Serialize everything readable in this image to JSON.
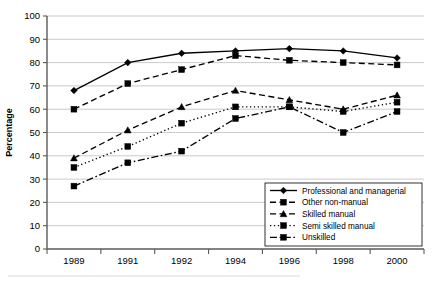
{
  "chart_data": {
    "type": "line",
    "title": "",
    "xlabel": "",
    "ylabel": "Percentage",
    "categories": [
      "1989",
      "1991",
      "1992",
      "1994",
      "1996",
      "1998",
      "2000"
    ],
    "x": [
      1989,
      1991,
      1992,
      1994,
      1996,
      1998,
      2000
    ],
    "ylim": [
      0,
      100
    ],
    "yticks": [
      0,
      10,
      20,
      30,
      40,
      50,
      60,
      70,
      80,
      90,
      100
    ],
    "grid": "horizontal",
    "legend_position": "bottom-right",
    "series": [
      {
        "name": "Professional and managerial",
        "values": [
          68,
          80,
          84,
          85,
          86,
          85,
          82
        ],
        "line_style": "solid",
        "marker": "diamond",
        "color": "#000000"
      },
      {
        "name": "Other non-manual",
        "values": [
          60,
          71,
          77,
          83,
          81,
          80,
          79
        ],
        "line_style": "dashed",
        "marker": "square",
        "color": "#000000"
      },
      {
        "name": "Skilled manual",
        "values": [
          39,
          51,
          61,
          68,
          64,
          60,
          66
        ],
        "line_style": "dashed",
        "marker": "triangle",
        "color": "#000000"
      },
      {
        "name": "Semi skilled manual",
        "values": [
          35,
          44,
          54,
          61,
          61,
          59,
          63
        ],
        "line_style": "dotted",
        "marker": "square",
        "color": "#000000"
      },
      {
        "name": "Unskilled",
        "values": [
          27,
          37,
          42,
          56,
          61,
          50,
          59
        ],
        "line_style": "dashdot",
        "marker": "square",
        "color": "#000000"
      }
    ]
  },
  "axis": {
    "y_label": "Percentage",
    "y_tick_labels": [
      "100",
      "90",
      "80",
      "70",
      "60",
      "50",
      "40",
      "30",
      "20",
      "10",
      "0"
    ],
    "x_tick_labels": [
      "1989",
      "1991",
      "1992",
      "1994",
      "1996",
      "1998",
      "2000"
    ]
  },
  "legend": {
    "items": [
      {
        "label": "Professional and managerial"
      },
      {
        "label": "Other non-manual"
      },
      {
        "label": "Skilled manual"
      },
      {
        "label": "Semi skilled manual"
      },
      {
        "label": "Unskilled"
      }
    ]
  }
}
